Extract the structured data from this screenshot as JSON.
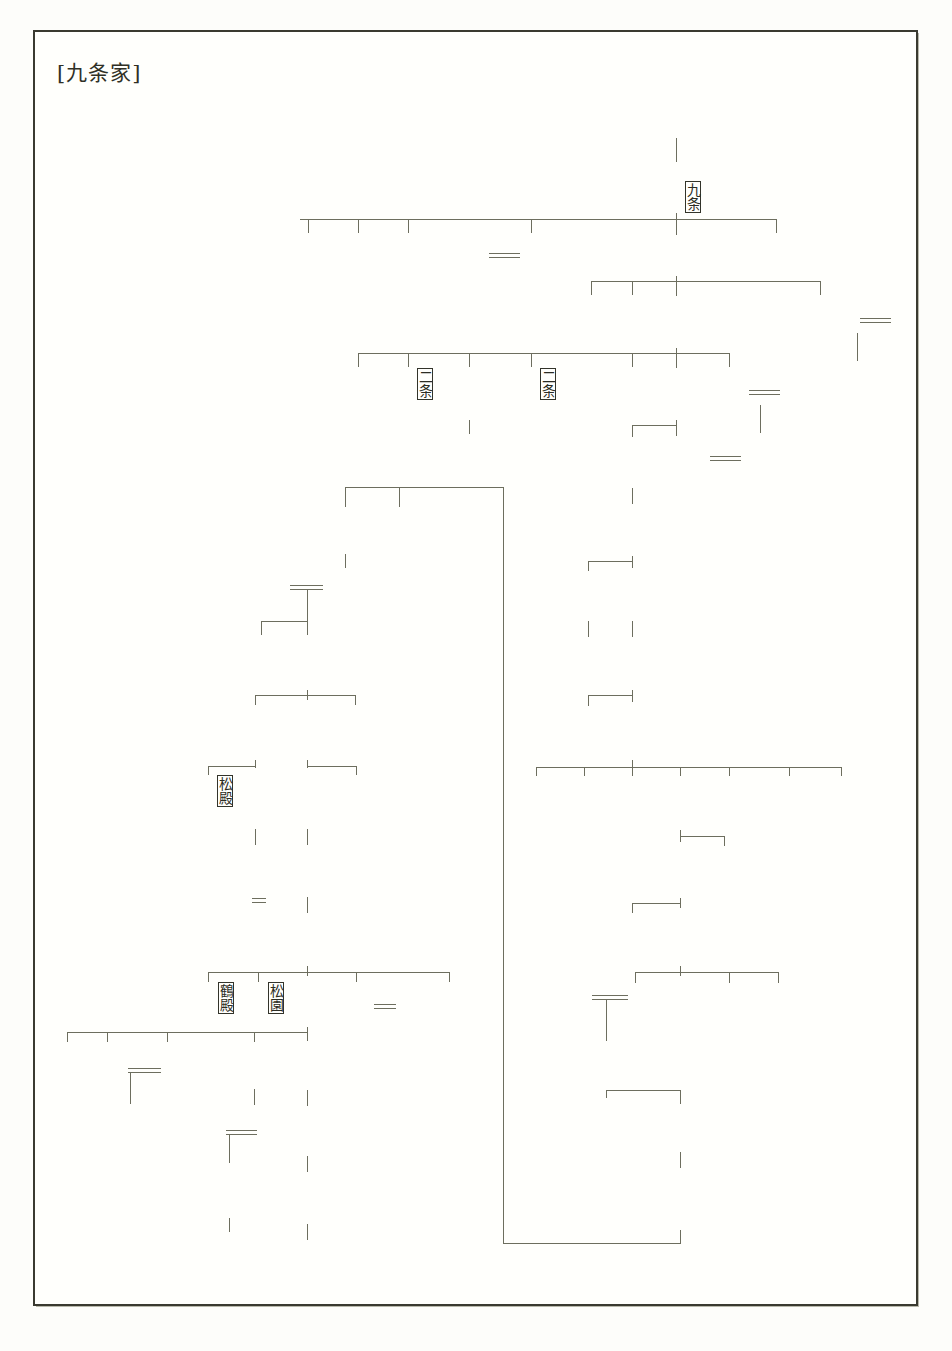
{
  "document": {
    "title": "[九条家]",
    "kind": "genealogy-chart",
    "language": "ja",
    "writing_mode": "vertical-rl",
    "ink_color": "#33342a",
    "rule_color": "#6d6e5e",
    "paper_color": "#fffffc"
  },
  "legend": {
    "number_meaning": "家督継承順(代数)",
    "single_rule": "親子",
    "double_rule": "婚姻",
    "bracket_tag": "分家・家名"
  },
  "people": [
    {
      "id": "n1",
      "name": "藤原忠通",
      "num": "",
      "x": 668,
      "y": 57,
      "tag": ""
    },
    {
      "id": "n2",
      "name": "兼実",
      "num": "1",
      "x": 668,
      "y": 163,
      "tag": "〔九条〕"
    },
    {
      "id": "n3",
      "name": "良輔",
      "num": "",
      "x": 300,
      "y": 233,
      "tag": ""
    },
    {
      "id": "n4",
      "name": "良平",
      "num": "",
      "x": 350,
      "y": 233,
      "tag": ""
    },
    {
      "id": "n5",
      "name": "良円",
      "num": "",
      "x": 400,
      "y": 233,
      "tag": ""
    },
    {
      "id": "n6",
      "name": "後鳥羽天皇",
      "num": "",
      "x": 461,
      "y": 233,
      "tag": ""
    },
    {
      "id": "n7",
      "name": "宜秋門院",
      "num": "",
      "x": 523,
      "y": 233,
      "tag": ""
    },
    {
      "id": "n8",
      "name": "良経",
      "num": "2",
      "x": 668,
      "y": 233,
      "tag": ""
    },
    {
      "id": "n9",
      "name": "良通",
      "num": "",
      "x": 768,
      "y": 233,
      "tag": ""
    },
    {
      "id": "n10",
      "name": "基家",
      "num": "",
      "x": 583,
      "y": 295,
      "tag": ""
    },
    {
      "id": "n11",
      "name": "教家",
      "num": "",
      "x": 624,
      "y": 295,
      "tag": ""
    },
    {
      "id": "n12",
      "name": "道家",
      "num": "3",
      "x": 668,
      "y": 295,
      "tag": ""
    },
    {
      "id": "n13",
      "name": "東一条院",
      "num": "",
      "x": 812,
      "y": 295,
      "tag": ""
    },
    {
      "id": "n14",
      "name": "順徳天皇",
      "num": "",
      "x": 891,
      "y": 295,
      "tag": ""
    },
    {
      "id": "n15",
      "name": "仲恭天皇",
      "num": "",
      "x": 849,
      "y": 295,
      "tag": ""
    },
    {
      "id": "n16",
      "name": "法助",
      "num": "",
      "x": 350,
      "y": 368,
      "tag": ""
    },
    {
      "id": "n17",
      "name": "実経",
      "num": "",
      "x": 400,
      "y": 368,
      "tag": "〔二条〕"
    },
    {
      "id": "n18",
      "name": "頼経",
      "num": "",
      "x": 461,
      "y": 368,
      "tag": ""
    },
    {
      "id": "n19",
      "name": "頼嗣",
      "num": "",
      "x": 461,
      "y": 435,
      "tag": ""
    },
    {
      "id": "n20",
      "name": "良実",
      "num": "",
      "x": 523,
      "y": 368,
      "tag": "〔二条〕"
    },
    {
      "id": "n21",
      "name": "円実",
      "num": "",
      "x": 624,
      "y": 368,
      "tag": ""
    },
    {
      "id": "n22",
      "name": "教実",
      "num": "4",
      "x": 668,
      "y": 368,
      "tag": ""
    },
    {
      "id": "n23",
      "name": "藻壁門院",
      "num": "",
      "x": 721,
      "y": 368,
      "tag": ""
    },
    {
      "id": "n24",
      "name": "後堀河天皇",
      "num": "",
      "x": 783,
      "y": 368,
      "tag": ""
    },
    {
      "id": "n25",
      "name": "四条天皇",
      "num": "",
      "x": 752,
      "y": 434,
      "tag": ""
    },
    {
      "id": "n26",
      "name": "忠家",
      "num": "5",
      "x": 624,
      "y": 437,
      "tag": ""
    },
    {
      "id": "n27",
      "name": "宣仁門院",
      "num": "",
      "x": 668,
      "y": 437,
      "tag": ""
    },
    {
      "id": "n28",
      "name": "忠教",
      "num": "6",
      "x": 624,
      "y": 504,
      "tag": ""
    },
    {
      "id": "n29",
      "name": "康道",
      "num": "",
      "x": 391,
      "y": 508,
      "tag": ""
    },
    {
      "id": "n30",
      "name": "道房",
      "num": "17",
      "x": 337,
      "y": 508,
      "tag": ""
    },
    {
      "id": "n31",
      "name": "房実",
      "num": "8",
      "x": 580,
      "y": 570,
      "tag": ""
    },
    {
      "id": "n32",
      "name": "師教",
      "num": "7",
      "x": 624,
      "y": 570,
      "tag": ""
    },
    {
      "id": "n33",
      "name": "侍姫",
      "num": "",
      "x": 337,
      "y": 570,
      "tag": ""
    },
    {
      "id": "n34",
      "name": "兼晴",
      "num": "18",
      "x": 270,
      "y": 570,
      "tag": ""
    },
    {
      "id": "n35",
      "name": "孝覚",
      "num": "",
      "x": 580,
      "y": 636,
      "tag": ""
    },
    {
      "id": "n36",
      "name": "道教",
      "num": "9",
      "x": 624,
      "y": 636,
      "tag": ""
    },
    {
      "id": "n37",
      "name": "輔実",
      "num": "19",
      "x": 299,
      "y": 636,
      "tag": ""
    },
    {
      "id": "n38",
      "name": "綱平",
      "num": "",
      "x": 253,
      "y": 636,
      "tag": ""
    },
    {
      "id": "n39",
      "name": "孝尊",
      "num": "",
      "x": 580,
      "y": 705,
      "tag": ""
    },
    {
      "id": "n40",
      "name": "経教",
      "num": "10",
      "x": 624,
      "y": 705,
      "tag": ""
    },
    {
      "id": "n41",
      "name": "師孝",
      "num": "20",
      "x": 347,
      "y": 705,
      "tag": ""
    },
    {
      "id": "n42",
      "name": "幸教",
      "num": "21",
      "x": 300,
      "y": 705,
      "tag": ""
    },
    {
      "id": "n43",
      "name": "尚実",
      "num": "23",
      "x": 247,
      "y": 705,
      "tag": ""
    },
    {
      "id": "n44",
      "name": "経覚",
      "num": "",
      "x": 528,
      "y": 775,
      "tag": ""
    },
    {
      "id": "n45",
      "name": "孝信",
      "num": "",
      "x": 576,
      "y": 775,
      "tag": ""
    },
    {
      "id": "n46",
      "name": "道尊",
      "num": "",
      "x": 624,
      "y": 775,
      "tag": ""
    },
    {
      "id": "n47",
      "name": "満家",
      "num": "11",
      "x": 672,
      "y": 775,
      "tag": ""
    },
    {
      "id": "n48",
      "name": "孝円",
      "num": "",
      "x": 721,
      "y": 775,
      "tag": ""
    },
    {
      "id": "n49",
      "name": "教嗣",
      "num": "",
      "x": 781,
      "y": 775,
      "tag": ""
    },
    {
      "id": "n50",
      "name": "忠基",
      "num": "",
      "x": 833,
      "y": 775,
      "tag": ""
    },
    {
      "id": "n51",
      "name": "稙基",
      "num": "22",
      "x": 347,
      "y": 775,
      "tag": ""
    },
    {
      "id": "n52",
      "name": "宗基",
      "num": "",
      "x": 300,
      "y": 775,
      "tag": ""
    },
    {
      "id": "n53",
      "name": "二条家を継ぐ",
      "num": "",
      "x": 322,
      "y": 775,
      "tag": ""
    },
    {
      "id": "n54",
      "name": "道前",
      "num": "24",
      "x": 247,
      "y": 775,
      "tag": ""
    },
    {
      "id": "n55",
      "name": "忠孝",
      "num": "",
      "x": 200,
      "y": 775,
      "tag": "〔松殿〕"
    },
    {
      "id": "n56",
      "name": "政基",
      "num": "12",
      "x": 672,
      "y": 845,
      "tag": ""
    },
    {
      "id": "n57",
      "name": "政忠",
      "num": "",
      "x": 716,
      "y": 845,
      "tag": ""
    },
    {
      "id": "n58",
      "name": "治孝",
      "num": "",
      "x": 300,
      "y": 845,
      "tag": ""
    },
    {
      "id": "n59",
      "name": "輔家",
      "num": "25",
      "x": 247,
      "y": 845,
      "tag": ""
    },
    {
      "id": "n60",
      "name": "澄之",
      "num": "",
      "x": 624,
      "y": 912,
      "tag": ""
    },
    {
      "id": "n61",
      "name": "尚経",
      "num": "13",
      "x": 672,
      "y": 912,
      "tag": ""
    },
    {
      "id": "n62",
      "name": "尚忠",
      "num": "27",
      "x": 300,
      "y": 912,
      "tag": ""
    },
    {
      "id": "n63",
      "name": "輔嗣",
      "num": "26",
      "x": 247,
      "y": 912,
      "tag": ""
    },
    {
      "id": "n64",
      "name": "二条尹房",
      "num": "",
      "x": 570,
      "y": 967,
      "tag": ""
    },
    {
      "id": "n65",
      "name": "経子",
      "num": "",
      "x": 627,
      "y": 982,
      "tag": ""
    },
    {
      "id": "n66",
      "name": "稙通",
      "num": "14",
      "x": 672,
      "y": 982,
      "tag": ""
    },
    {
      "id": "n67",
      "name": "経尋",
      "num": "",
      "x": 721,
      "y": 982,
      "tag": ""
    },
    {
      "id": "n68",
      "name": "家輔",
      "num": "",
      "x": 770,
      "y": 982,
      "tag": ""
    },
    {
      "id": "n69",
      "name": "幸経",
      "num": "28",
      "x": 441,
      "y": 982,
      "tag": ""
    },
    {
      "id": "n70",
      "name": "孝明天皇",
      "num": "",
      "x": 397,
      "y": 982,
      "tag": ""
    },
    {
      "id": "n71",
      "name": "英照皇太后",
      "num": "",
      "x": 348,
      "y": 982,
      "tag": ""
    },
    {
      "id": "n72",
      "name": "道孝",
      "num": "29",
      "x": 300,
      "y": 982,
      "tag": ""
    },
    {
      "id": "n73",
      "name": "尚嘉",
      "num": "",
      "x": 251,
      "y": 982,
      "tag": "〔松園〕"
    },
    {
      "id": "n74",
      "name": "基弘",
      "num": "",
      "x": 201,
      "y": 982,
      "tag": "〔鶴殿〕"
    },
    {
      "id": "n75",
      "name": "晴良",
      "num": "",
      "x": 598,
      "y": 1040,
      "tag": ""
    },
    {
      "id": "n76",
      "name": "良致",
      "num": "",
      "x": 60,
      "y": 1042,
      "tag": ""
    },
    {
      "id": "n77",
      "name": "大正天皇",
      "num": "",
      "x": 100,
      "y": 1042,
      "tag": ""
    },
    {
      "id": "n78",
      "name": "昭和天皇",
      "num": "",
      "x": 122,
      "y": 1104,
      "tag": ""
    },
    {
      "id": "n79",
      "name": "貞明皇后",
      "num": "",
      "x": 160,
      "y": 1042,
      "tag": ""
    },
    {
      "id": "n80",
      "name": "松尾善徳",
      "num": "",
      "x": 196,
      "y": 1060,
      "tag": ""
    },
    {
      "id": "n81",
      "name": "良政",
      "num": "",
      "x": 247,
      "y": 1042,
      "tag": ""
    },
    {
      "id": "n82",
      "name": "男爵家",
      "num": "",
      "x": 270,
      "y": 1042,
      "tag": "",
      "bold": true
    },
    {
      "id": "n83",
      "name": "道実",
      "num": "30",
      "x": 300,
      "y": 1042,
      "tag": ""
    },
    {
      "id": "n84",
      "name": "倭文子",
      "num": "",
      "x": 247,
      "y": 1106,
      "tag": ""
    },
    {
      "id": "n85",
      "name": "義秀",
      "num": "",
      "x": 222,
      "y": 1163,
      "tag": ""
    },
    {
      "id": "n86",
      "name": "良弘",
      "num": "",
      "x": 222,
      "y": 1233,
      "tag": ""
    },
    {
      "id": "n87",
      "name": "道秀",
      "num": "31",
      "x": 300,
      "y": 1107,
      "tag": ""
    },
    {
      "id": "n88",
      "name": "道弘",
      "num": "32",
      "x": 300,
      "y": 1172,
      "tag": ""
    },
    {
      "id": "n89",
      "name": "道成",
      "num": "",
      "x": 300,
      "y": 1240,
      "tag": ""
    },
    {
      "id": "n90",
      "name": "昭実",
      "num": "",
      "x": 598,
      "y": 1103,
      "tag": ""
    },
    {
      "id": "n91",
      "name": "兼孝",
      "num": "15",
      "x": 672,
      "y": 1103,
      "tag": ""
    },
    {
      "id": "n92",
      "name": "幸家",
      "num": "16",
      "x": 672,
      "y": 1167,
      "tag": ""
    }
  ],
  "generations": {
    "ordered": [
      "兼実",
      "良経",
      "道家",
      "教実",
      "忠家",
      "忠教",
      "師教",
      "房実",
      "道教",
      "経教",
      "満家",
      "政基",
      "尚経",
      "稙通",
      "兼孝",
      "幸家",
      "道房",
      "兼晴",
      "輔実",
      "師孝",
      "幸教",
      "稙基",
      "尚実",
      "道前",
      "輔家",
      "輔嗣",
      "尚忠",
      "幸経",
      "道孝",
      "道実",
      "道秀",
      "道弘"
    ],
    "count": 32
  },
  "house_tags": [
    "〔九条〕",
    "〔二条〕",
    "〔松殿〕",
    "〔松園〕",
    "〔鶴殿〕"
  ],
  "notes": [
    "二条家を継ぐ",
    "男爵家"
  ]
}
